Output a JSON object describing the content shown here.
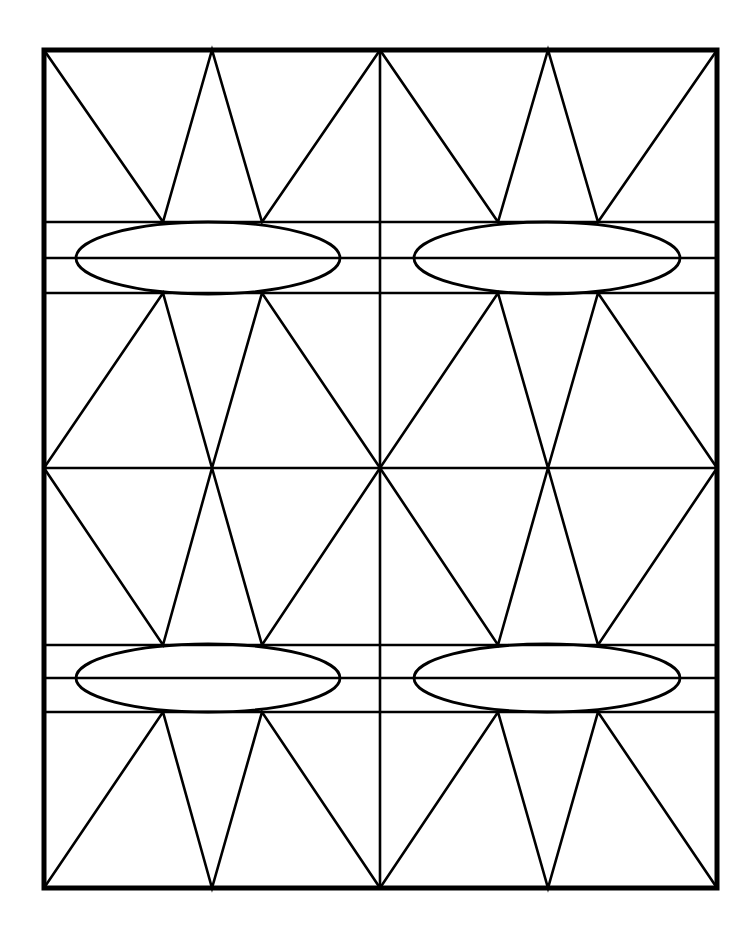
{
  "figure": {
    "name": "symmetric-geometric-lattice",
    "canvas_width": 750,
    "canvas_height": 929,
    "background_color": "#ffffff",
    "ink_color": "#000000"
  },
  "chart_data": {
    "type": "diagram",
    "subtitle": "",
    "xlabel": "",
    "ylabel": "",
    "grid": true,
    "legend_position": "none",
    "xlim": [
      0,
      750
    ],
    "ylim": [
      0,
      929
    ],
    "units": "pixels",
    "frame": {
      "left": 44,
      "top": 50,
      "right": 717,
      "bottom": 888,
      "width": 673,
      "height": 838,
      "stroke_width": 5,
      "fill": "none",
      "stroke": "#000000"
    },
    "anchors": {
      "x": [
        44,
        163,
        212,
        262,
        380,
        498,
        548,
        598,
        717
      ],
      "y": [
        50,
        222,
        258,
        293,
        468,
        645,
        678,
        712,
        888
      ],
      "center_x": 380,
      "center_y": 468
    },
    "horizontal_lines": [
      {
        "id": "band1-top",
        "y": 222,
        "x1": 44,
        "x2": 717,
        "stroke_width": 2.6
      },
      {
        "id": "band1-mid",
        "y": 258,
        "x1": 44,
        "x2": 717,
        "stroke_width": 2.6
      },
      {
        "id": "band1-bottom",
        "y": 293,
        "x1": 44,
        "x2": 717,
        "stroke_width": 2.6
      },
      {
        "id": "center-axis",
        "y": 468,
        "x1": 44,
        "x2": 717,
        "stroke_width": 2.6
      },
      {
        "id": "band2-top",
        "y": 645,
        "x1": 44,
        "x2": 717,
        "stroke_width": 2.6
      },
      {
        "id": "band2-mid",
        "y": 678,
        "x1": 44,
        "x2": 717,
        "stroke_width": 2.6
      },
      {
        "id": "band2-bottom",
        "y": 712,
        "x1": 44,
        "x2": 717,
        "stroke_width": 2.6
      }
    ],
    "vertical_lines": [
      {
        "id": "center-vertical",
        "x": 380,
        "y1": 50,
        "y2": 888,
        "stroke_width": 2.6
      }
    ],
    "ellipses": [
      {
        "id": "ellipse-top-left",
        "cx": 208,
        "cy": 258,
        "rx": 132,
        "ry": 36,
        "stroke_width": 2.8,
        "fill": "none"
      },
      {
        "id": "ellipse-top-right",
        "cx": 547,
        "cy": 258,
        "rx": 133,
        "ry": 36,
        "stroke_width": 2.8,
        "fill": "none"
      },
      {
        "id": "ellipse-bottom-left",
        "cx": 208,
        "cy": 678,
        "rx": 132,
        "ry": 34,
        "stroke_width": 2.8,
        "fill": "none"
      },
      {
        "id": "ellipse-bottom-right",
        "cx": 547,
        "cy": 678,
        "rx": 133,
        "ry": 34,
        "stroke_width": 2.8,
        "fill": "none"
      }
    ],
    "zigzags": [
      {
        "id": "zigzag-top-left",
        "region": "top band, left half",
        "stroke_width": 2.6,
        "points": [
          [
            44,
            50
          ],
          [
            163,
            222
          ],
          [
            212,
            50
          ],
          [
            262,
            222
          ],
          [
            380,
            50
          ]
        ]
      },
      {
        "id": "zigzag-top-right",
        "region": "top band, right half",
        "stroke_width": 2.6,
        "points": [
          [
            380,
            50
          ],
          [
            498,
            222
          ],
          [
            548,
            50
          ],
          [
            598,
            222
          ],
          [
            717,
            50
          ]
        ]
      },
      {
        "id": "zigzag-upper-mid-left",
        "region": "upper middle, left half",
        "stroke_width": 2.6,
        "points": [
          [
            44,
            468
          ],
          [
            163,
            293
          ],
          [
            212,
            468
          ],
          [
            262,
            293
          ],
          [
            380,
            468
          ]
        ]
      },
      {
        "id": "zigzag-upper-mid-right",
        "region": "upper middle, right half",
        "stroke_width": 2.6,
        "points": [
          [
            380,
            468
          ],
          [
            498,
            293
          ],
          [
            548,
            468
          ],
          [
            598,
            293
          ],
          [
            717,
            468
          ]
        ]
      },
      {
        "id": "zigzag-lower-mid-left",
        "region": "lower middle, left half",
        "stroke_width": 2.6,
        "points": [
          [
            44,
            468
          ],
          [
            163,
            645
          ],
          [
            212,
            468
          ],
          [
            262,
            645
          ],
          [
            380,
            468
          ]
        ]
      },
      {
        "id": "zigzag-lower-mid-right",
        "region": "lower middle, right half",
        "stroke_width": 2.6,
        "points": [
          [
            380,
            468
          ],
          [
            498,
            645
          ],
          [
            548,
            468
          ],
          [
            598,
            645
          ],
          [
            717,
            468
          ]
        ]
      },
      {
        "id": "zigzag-bottom-left",
        "region": "bottom band, left half",
        "stroke_width": 2.6,
        "points": [
          [
            44,
            888
          ],
          [
            163,
            712
          ],
          [
            212,
            888
          ],
          [
            262,
            712
          ],
          [
            380,
            888
          ]
        ]
      },
      {
        "id": "zigzag-bottom-right",
        "region": "bottom band, right half",
        "stroke_width": 2.6,
        "points": [
          [
            380,
            888
          ],
          [
            498,
            712
          ],
          [
            548,
            888
          ],
          [
            598,
            712
          ],
          [
            717,
            888
          ]
        ]
      }
    ],
    "symmetry": {
      "vertical_mirror_axis_x": 380,
      "horizontal_mirror_axis_y": 468,
      "center_node_rays": 8
    }
  }
}
